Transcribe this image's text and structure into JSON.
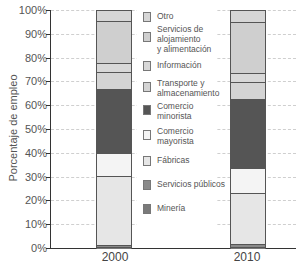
{
  "chart_data": {
    "type": "bar",
    "stacked": true,
    "title": "",
    "xlabel": "",
    "ylabel": "Porcentaje de empleo",
    "ylim": [
      0,
      100
    ],
    "yticks": [
      "0%",
      "10%",
      "20%",
      "30%",
      "40%",
      "50%",
      "60%",
      "70%",
      "80%",
      "90%",
      "100%"
    ],
    "grid": true,
    "legend_position": "center",
    "categories": [
      "2000",
      "2010"
    ],
    "series": [
      {
        "name": "Minería",
        "color": "#7a7a7a",
        "values": [
          0.8,
          0.8
        ]
      },
      {
        "name": "Servicios públicos",
        "color": "#8a8a8a",
        "values": [
          1.0,
          1.2
        ]
      },
      {
        "name": "Fábricas",
        "color": "#e6e6e6",
        "values": [
          28.9,
          21.5
        ]
      },
      {
        "name": "Comercio mayorista",
        "color": "#f4f4f4",
        "values": [
          9.6,
          10.5
        ]
      },
      {
        "name": "Comercio minorista",
        "color": "#555555",
        "values": [
          26.9,
          29.0
        ]
      },
      {
        "name": "Transporte y almacenamiento",
        "color": "#d4d4d4",
        "values": [
          7.2,
          7.0
        ]
      },
      {
        "name": "Información",
        "color": "#d8d8d8",
        "values": [
          3.8,
          3.8
        ]
      },
      {
        "name": "Servicios de alojamiento y alimentación",
        "color": "#cfcfcf",
        "values": [
          17.6,
          21.4
        ]
      },
      {
        "name": "Otro",
        "color": "#d6d6d6",
        "values": [
          4.2,
          4.8
        ]
      }
    ]
  },
  "axis": {
    "ylabel": "Porcentaje de empleo",
    "ticks": [
      "100%",
      "90%",
      "80%",
      "70%",
      "60%",
      "50%",
      "40%",
      "30%",
      "20%",
      "10%",
      "0%"
    ],
    "x": [
      "2000",
      "2010"
    ]
  },
  "legend": [
    {
      "label": "Otro",
      "color": "#d6d6d6"
    },
    {
      "label": "Servicios de\nalojamiento\ny alimentación",
      "color": "#cfcfcf"
    },
    {
      "label": "Información",
      "color": "#d8d8d8"
    },
    {
      "label": "Transporte y\nalmacenamiento",
      "color": "#d4d4d4"
    },
    {
      "label": "Comercio\nminorista",
      "color": "#555555"
    },
    {
      "label": "Comercio\nmayorista",
      "color": "#f4f4f4"
    },
    {
      "label": "Fábricas",
      "color": "#e6e6e6"
    },
    {
      "label": "Servicios públicos",
      "color": "#8a8a8a"
    },
    {
      "label": "Minería",
      "color": "#7a7a7a"
    }
  ]
}
